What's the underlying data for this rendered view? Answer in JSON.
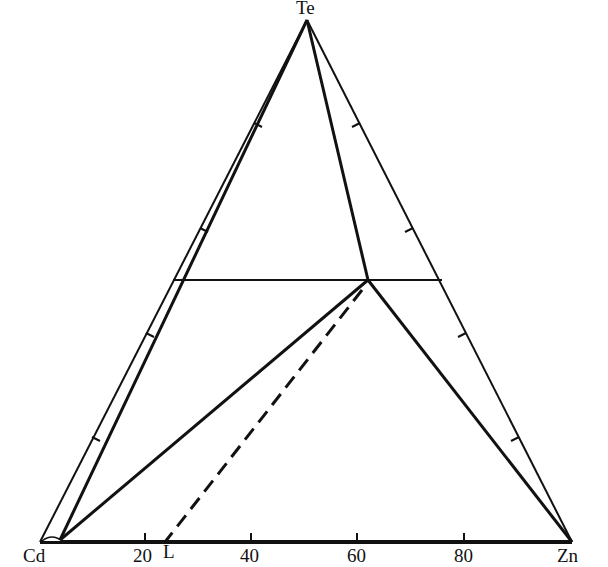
{
  "diagram": {
    "type": "ternary-phase-diagram",
    "vertices": {
      "top": "Te",
      "bottom_left": "Cd",
      "bottom_right": "Zn"
    },
    "bottom_axis": {
      "ticks": [
        "20",
        "40",
        "60",
        "80"
      ],
      "marker_label": "L"
    },
    "colors": {
      "line": "#111111",
      "background": "#ffffff"
    }
  }
}
